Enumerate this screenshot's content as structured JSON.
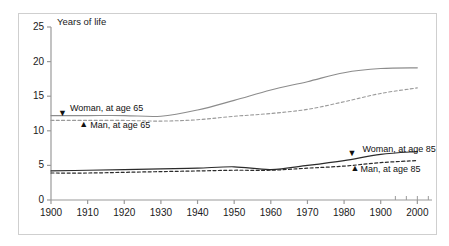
{
  "chart_data": {
    "type": "line",
    "title": "",
    "ylabel": "Years of life",
    "xlabel": "",
    "xlim": [
      1900,
      2004
    ],
    "ylim": [
      0,
      25
    ],
    "grid": false,
    "legend_position": "inline-annotations",
    "x_ticks": [
      "1900",
      "1910",
      "1920",
      "1930",
      "1940",
      "1950",
      "1960",
      "1970",
      "1980",
      "1900",
      "2000"
    ],
    "x_tick_values": [
      1900,
      1910,
      1920,
      1930,
      1940,
      1950,
      1960,
      1970,
      1980,
      1990,
      2000
    ],
    "y_ticks": [
      "0",
      "5",
      "10",
      "15",
      "20",
      "25"
    ],
    "y_tick_values": [
      0,
      5,
      10,
      15,
      20,
      25
    ],
    "x": [
      1900,
      1910,
      1920,
      1930,
      1940,
      1950,
      1960,
      1970,
      1980,
      1990,
      2000
    ],
    "series": [
      {
        "name": "Woman, at age 65",
        "style": "solid",
        "color": "#8c8c8c",
        "values": [
          12.2,
          12.2,
          12.2,
          12.1,
          13.0,
          14.4,
          15.9,
          17.1,
          18.4,
          19.0,
          19.1
        ]
      },
      {
        "name": "Man, at age 65",
        "style": "dashed",
        "color": "#9a9a9a",
        "values": [
          11.5,
          11.5,
          11.5,
          11.4,
          11.6,
          12.1,
          12.5,
          13.1,
          14.2,
          15.4,
          16.2
        ]
      },
      {
        "name": "Woman, at age 85",
        "style": "solid",
        "color": "#2b2b2b",
        "values": [
          4.2,
          4.3,
          4.4,
          4.5,
          4.6,
          4.8,
          4.4,
          5.0,
          5.7,
          6.6,
          7.0
        ]
      },
      {
        "name": "Man, at age 85",
        "style": "dashed",
        "color": "#2b2b2b",
        "values": [
          3.9,
          3.9,
          4.0,
          4.1,
          4.2,
          4.3,
          4.3,
          4.6,
          4.9,
          5.4,
          5.7
        ]
      }
    ],
    "annotations": [
      {
        "label": "Woman, at age 65",
        "marker": "▼",
        "at_x": 1903,
        "at_y": 12.2
      },
      {
        "label": "Man, at age 65",
        "marker": "▲",
        "at_x": 1908,
        "at_y": 10.7
      },
      {
        "label": "Woman, at age 85",
        "marker": "▼",
        "at_x": 1982,
        "at_y": 6.4
      },
      {
        "label": "Man, at age 85",
        "marker": "▲",
        "at_x": 1982,
        "at_y": 4.3
      }
    ]
  }
}
